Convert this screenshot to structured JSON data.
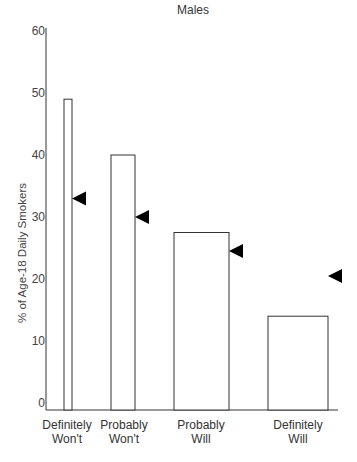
{
  "chart_data": {
    "type": "bar",
    "title": "Males",
    "xlabel": "",
    "ylabel": "% of Age-18 Daily Smokers",
    "ylim": [
      0,
      60
    ],
    "yticks": [
      0,
      10,
      20,
      30,
      40,
      50,
      60
    ],
    "grid": false,
    "categories": [
      "Definitely Won't",
      "Probably Won't",
      "Probably Will",
      "Definitely Will"
    ],
    "category_lines": [
      [
        "Definitely",
        "Won't"
      ],
      [
        "Probably",
        "Won't"
      ],
      [
        "Probably",
        "Will"
      ],
      [
        "Definitely",
        "Will"
      ]
    ],
    "series": [
      {
        "name": "Bars (% of age-18 daily smokers)",
        "style": "hollow-bar",
        "values": [
          49,
          40,
          27.5,
          14
        ]
      },
      {
        "name": "Triangle markers",
        "style": "left-pointing-triangle",
        "color": "#000000",
        "values": [
          33,
          30,
          24.5,
          20.5
        ]
      }
    ],
    "bar_relative_widths": [
      1,
      3,
      7,
      7.5
    ]
  }
}
